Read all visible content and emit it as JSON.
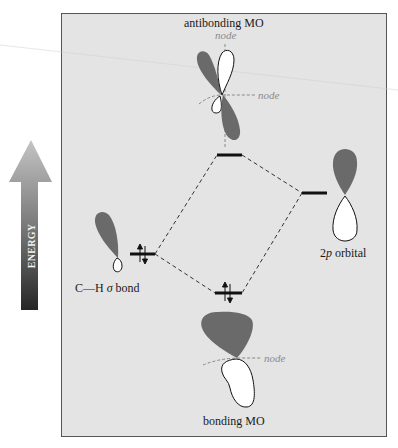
{
  "figure": {
    "title_top": "antibonding MO",
    "title_bottom": "bonding MO",
    "energy_axis_label": "ENERGY",
    "left_orbital_label_prefix": "C—H ",
    "left_orbital_label_sigma": "σ",
    "left_orbital_label_suffix": " bond",
    "right_orbital_label_prefix": "2",
    "right_orbital_label_p": "p",
    "right_orbital_label_suffix": " orbital",
    "node_labels": [
      "node",
      "node",
      "node"
    ]
  },
  "levels": [
    {
      "name": "antibonding MO",
      "electrons": 0
    },
    {
      "name": "2p orbital",
      "electrons": 0
    },
    {
      "name": "C—H σ bond",
      "electrons": 2
    },
    {
      "name": "bonding MO",
      "electrons": 2
    }
  ],
  "colors": {
    "panel_bg": "#e4e4e4",
    "frame": "#555555",
    "shaded_lobe": "#6a6a6a",
    "unshaded_lobe": "#ffffff",
    "level_line": "#111111",
    "dash_line": "#333333",
    "node_line": "#888888",
    "arrow_top": "#b8b8b8",
    "arrow_bottom": "#2a2a2a"
  }
}
